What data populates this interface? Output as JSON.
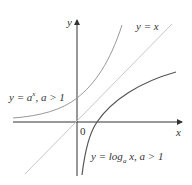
{
  "diagram": {
    "axes": {
      "x_label": "x",
      "y_label": "y",
      "origin_label": "0"
    },
    "curves": [
      {
        "name": "exponential",
        "label_main": "y = a",
        "label_sup": "x",
        "label_cond": ", a > 1",
        "color": "#999999"
      },
      {
        "name": "identity",
        "label": "y = x",
        "color": "#c8c8c8"
      },
      {
        "name": "logarithm",
        "label_main": "y = log",
        "label_sub": "a",
        "label_rest": " x, a > 1",
        "color": "#555555"
      }
    ]
  }
}
